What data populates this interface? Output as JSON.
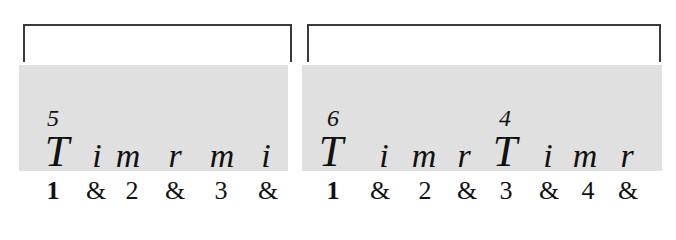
{
  "measures": [
    {
      "bracket": {
        "left": 23,
        "right": 292,
        "top": 24,
        "bottom": 62
      },
      "panel": {
        "left": 19,
        "right": 288,
        "top": 65,
        "bottom": 171
      },
      "numbers": [
        {
          "text": "5",
          "x": 53
        }
      ],
      "syllables": [
        {
          "text": "T",
          "x": 57,
          "size": "big"
        },
        {
          "text": "i",
          "x": 97,
          "size": "small"
        },
        {
          "text": "m",
          "x": 128,
          "size": "small"
        },
        {
          "text": "r",
          "x": 175,
          "size": "small"
        },
        {
          "text": "m",
          "x": 222,
          "size": "small"
        },
        {
          "text": "i",
          "x": 266,
          "size": "small"
        }
      ],
      "counts": [
        {
          "text": "1",
          "x": 53,
          "beat": true
        },
        {
          "text": "&",
          "x": 96,
          "beat": false
        },
        {
          "text": "2",
          "x": 132,
          "beat": false
        },
        {
          "text": "&",
          "x": 175,
          "beat": false
        },
        {
          "text": "3",
          "x": 221,
          "beat": false
        },
        {
          "text": "&",
          "x": 268,
          "beat": false
        }
      ]
    },
    {
      "bracket": {
        "left": 307,
        "right": 661,
        "top": 24,
        "bottom": 62
      },
      "panel": {
        "left": 302,
        "right": 662,
        "top": 65,
        "bottom": 171
      },
      "numbers": [
        {
          "text": "6",
          "x": 333
        },
        {
          "text": "4",
          "x": 505
        }
      ],
      "syllables": [
        {
          "text": "T",
          "x": 331,
          "size": "big"
        },
        {
          "text": "i",
          "x": 384,
          "size": "small"
        },
        {
          "text": "m",
          "x": 424,
          "size": "small"
        },
        {
          "text": "r",
          "x": 464,
          "size": "small"
        },
        {
          "text": "T",
          "x": 505,
          "size": "big"
        },
        {
          "text": "i",
          "x": 548,
          "size": "small"
        },
        {
          "text": "m",
          "x": 585,
          "size": "small"
        },
        {
          "text": "r",
          "x": 627,
          "size": "small"
        }
      ],
      "counts": [
        {
          "text": "1",
          "x": 333,
          "beat": true
        },
        {
          "text": "&",
          "x": 380,
          "beat": false
        },
        {
          "text": "2",
          "x": 425,
          "beat": false
        },
        {
          "text": "&",
          "x": 467,
          "beat": false
        },
        {
          "text": "3",
          "x": 506,
          "beat": false
        },
        {
          "text": "&",
          "x": 549,
          "beat": false
        },
        {
          "text": "4",
          "x": 588,
          "beat": false
        },
        {
          "text": "&",
          "x": 628,
          "beat": false
        }
      ]
    }
  ],
  "colors": {
    "panel": "#e0e0e0",
    "bracket": "#3a3a3a",
    "text": "#111111"
  }
}
